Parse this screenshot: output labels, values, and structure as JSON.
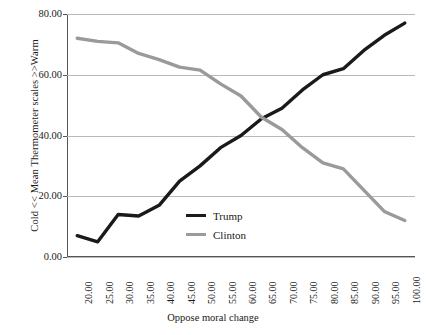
{
  "chart_data": {
    "type": "line",
    "title": "",
    "xlabel": "Oppose moral change",
    "ylabel": "Cold << Mean Thermometer scales >>Warm",
    "categories": [
      "20.00",
      "25.00",
      "30.00",
      "35.00",
      "40.00",
      "45.00",
      "50.00",
      "55.00",
      "60.00",
      "65.00",
      "70.00",
      "75.00",
      "80.00",
      "85.00",
      "90.00",
      "95.00",
      "100.00"
    ],
    "x": [
      20,
      25,
      30,
      35,
      40,
      45,
      50,
      55,
      60,
      65,
      70,
      75,
      80,
      85,
      90,
      95,
      100
    ],
    "series": [
      {
        "name": "Trump",
        "color": "#1a1a1a",
        "values": [
          7.0,
          5.0,
          14.0,
          13.5,
          17.0,
          25.0,
          30.0,
          36.0,
          40.0,
          45.5,
          49.0,
          55.0,
          60.0,
          62.0,
          68.0,
          73.0,
          77.0
        ]
      },
      {
        "name": "Clinton",
        "color": "#9a9a9a",
        "values": [
          72.0,
          71.0,
          70.5,
          67.0,
          65.0,
          62.5,
          61.5,
          57.0,
          53.0,
          46.0,
          42.0,
          36.0,
          31.0,
          29.0,
          22.0,
          15.0,
          12.0
        ]
      }
    ],
    "ylim": [
      0,
      80
    ],
    "yticks": [
      0,
      20,
      40,
      60,
      80
    ],
    "ytick_labels": [
      "0.00",
      "20.00",
      "40.00",
      "60.00",
      "80.00"
    ],
    "grid": true,
    "legend_position": "inside-center-bottom"
  },
  "legend": {
    "entries": [
      {
        "label": "Trump"
      },
      {
        "label": "Clinton"
      }
    ]
  },
  "axes": {
    "y_title": "Cold << Mean Thermometer scales >>Warm",
    "x_title": "Oppose moral change"
  }
}
